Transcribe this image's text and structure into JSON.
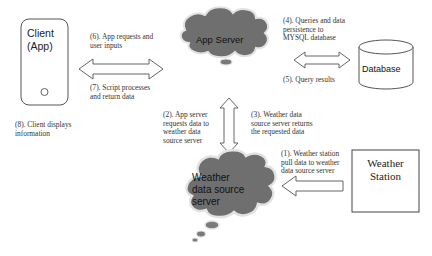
{
  "diagram": {
    "nodes": {
      "client": {
        "line1": "Client",
        "line2": "(App)"
      },
      "app_server": {
        "label": "App Server"
      },
      "database": {
        "label": "Database"
      },
      "weather_source": {
        "line1": "Weather",
        "line2": "data source",
        "line3": "server"
      },
      "weather_station": {
        "line1": "Weather",
        "line2": "Station"
      }
    },
    "steps": {
      "s1": {
        "line1": "(1). Weather station",
        "line2": "pull data to weather",
        "line3": "data source server"
      },
      "s2": {
        "line1": "(2). App server",
        "line2": "requests data to",
        "line3": "weather data",
        "line4": "source server"
      },
      "s3": {
        "line1": "(3). Weather data",
        "line2": "source server returns",
        "line3": "the requested data"
      },
      "s4": {
        "line1": "(4). Queries and data",
        "line2": "persistence to",
        "line3": "MYSQL database"
      },
      "s5": {
        "line1": "(5). Query results"
      },
      "s6": {
        "line1": "(6). App requests and",
        "line2": "user inputs"
      },
      "s7": {
        "line1": "(7). Script processes",
        "line2": "and return data"
      },
      "s8": {
        "line1": "(8). Client displays",
        "line2": "information"
      }
    },
    "colors": {
      "cloud_fill": "#6f6f6f",
      "cloud_stroke": "#dcdcdc",
      "line": "#444444"
    }
  }
}
